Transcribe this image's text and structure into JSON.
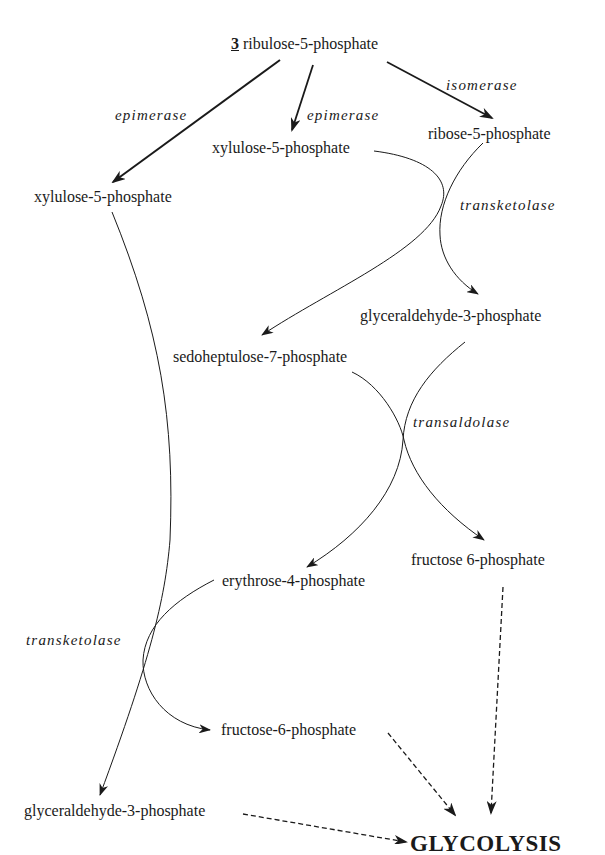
{
  "diagram": {
    "start": {
      "count": "3",
      "name": "ribulose-5-phosphate"
    },
    "nodes": {
      "xylulose_left": "xylulose-5-phosphate",
      "xylulose_mid": "xylulose-5-phosphate",
      "ribose": "ribose-5-phosphate",
      "g3p_upper": "glyceraldehyde-3-phosphate",
      "sedoheptulose": "sedoheptulose-7-phosphate",
      "fructose_right": "fructose 6-phosphate",
      "erythrose": "erythrose-4-phosphate",
      "fructose_lower": "fructose-6-phosphate",
      "g3p_lower": "glyceraldehyde-3-phosphate",
      "glycolysis": "GLYCOLYSIS"
    },
    "enzymes": {
      "epimerase_left": "epimerase",
      "epimerase_mid": "epimerase",
      "isomerase": "isomerase",
      "transketolase_upper": "transketolase",
      "transaldolase": "transaldolase",
      "transketolase_lower": "transketolase"
    },
    "edges": [
      {
        "from": "ribulose-5-phosphate",
        "to": "xylulose-5-phosphate (left)",
        "enzyme": "epimerase",
        "style": "solid-bold"
      },
      {
        "from": "ribulose-5-phosphate",
        "to": "xylulose-5-phosphate (mid)",
        "enzyme": "epimerase",
        "style": "solid-bold"
      },
      {
        "from": "ribulose-5-phosphate",
        "to": "ribose-5-phosphate",
        "enzyme": "isomerase",
        "style": "solid-bold"
      },
      {
        "from": "xylulose-5-phosphate (mid) + ribose-5-phosphate",
        "to": "glyceraldehyde-3-phosphate + sedoheptulose-7-phosphate",
        "enzyme": "transketolase",
        "style": "solid"
      },
      {
        "from": "sedoheptulose-7-phosphate + glyceraldehyde-3-phosphate",
        "to": "fructose 6-phosphate + erythrose-4-phosphate",
        "enzyme": "transaldolase",
        "style": "solid"
      },
      {
        "from": "xylulose-5-phosphate (left) + erythrose-4-phosphate",
        "to": "glyceraldehyde-3-phosphate + fructose-6-phosphate",
        "enzyme": "transketolase",
        "style": "solid"
      },
      {
        "from": "fructose 6-phosphate",
        "to": "GLYCOLYSIS",
        "style": "dashed"
      },
      {
        "from": "fructose-6-phosphate",
        "to": "GLYCOLYSIS",
        "style": "dashed"
      },
      {
        "from": "glyceraldehyde-3-phosphate",
        "to": "GLYCOLYSIS",
        "style": "dashed"
      }
    ],
    "colors": {
      "ink": "#1a1a1a",
      "background": "#ffffff"
    }
  }
}
